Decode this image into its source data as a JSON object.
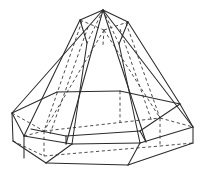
{
  "figure": {
    "caption": "",
    "style": {
      "background": "#ffffff",
      "visible_edge_color": "#2b2b2b",
      "hidden_edge_color": "#434343",
      "visible_edge_width": 1.05,
      "hidden_edge_width": 0.95,
      "hidden_dash_pattern": "3.2 2.6"
    },
    "canvas": {
      "width": 206,
      "height": 183
    },
    "solid": {
      "name": "hexagonal frustum over hexagonal prism",
      "apex_label": "",
      "parts": [
        "upper-pyramid-frustum",
        "lower-hexagonal-prism"
      ]
    },
    "vertices": {
      "apex": [
        103,
        10
      ],
      "top_small_hex": [
        [
          80,
          20
        ],
        [
          103,
          10
        ],
        [
          128,
          22
        ],
        [
          127,
          36
        ],
        [
          103,
          45
        ],
        [
          80,
          34
        ]
      ],
      "prism_top_hex": [
        [
          12,
          113
        ],
        [
          57,
          92
        ],
        [
          120,
          91
        ],
        [
          180,
          104
        ],
        [
          193,
          127
        ],
        [
          140,
          143
        ],
        [
          72,
          144
        ],
        [
          24,
          136
        ]
      ],
      "prism_bottom_hex": [
        [
          13,
          141
        ],
        [
          46,
          163
        ],
        [
          128,
          165
        ],
        [
          193,
          143
        ]
      ]
    },
    "edges": {
      "visible": [
        "apex-to-left-base",
        "apex-to-right-base",
        "apex-to-front-base",
        "top-hex-left-edge",
        "top-hex-right-edge",
        "prism-top-front-edges",
        "prism-left-vertical",
        "prism-front-verticals",
        "prism-right-vertical",
        "prism-bottom-front-edges"
      ],
      "hidden": [
        "top-hex-rear-edges",
        "apex-to-rear-base",
        "prism-rear-top-edges",
        "prism-rear-verticals",
        "prism-rear-bottom-edges"
      ]
    }
  }
}
